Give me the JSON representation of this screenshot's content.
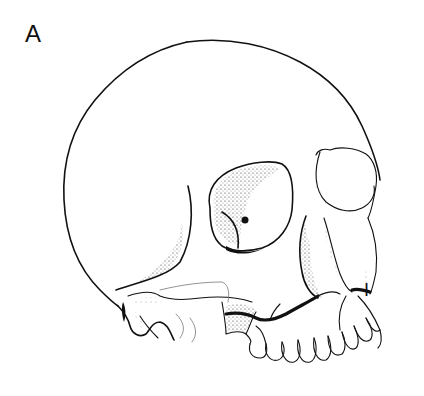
{
  "figure": {
    "panel_label": "A",
    "annotation_label": "I",
    "ink_color": "#111111",
    "background_color": "#ffffff"
  }
}
